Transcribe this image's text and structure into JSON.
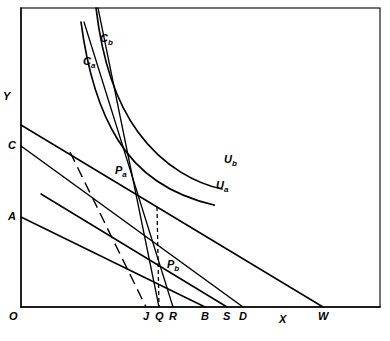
{
  "figure": {
    "kind": "economics-indifference-curve-diagram",
    "background_color": "#ffffff",
    "ink_color": "#000000",
    "axes": {
      "y_label": "Y",
      "x_label": "X",
      "origin_label": "O",
      "origin_px": [
        21,
        307
      ],
      "x_axis_end_px": [
        380,
        307
      ],
      "y_axis_top_px": [
        21,
        8
      ]
    },
    "y_intercept_labels": [
      {
        "name": "C",
        "text": "C",
        "y_px": 146
      },
      {
        "name": "A",
        "text": "A",
        "y_px": 217
      }
    ],
    "x_tick_labels": [
      {
        "name": "J",
        "text": "J",
        "x_px": 146
      },
      {
        "name": "Q",
        "text": "Q",
        "x_px": 159
      },
      {
        "name": "R",
        "text": "R",
        "x_px": 173
      },
      {
        "name": "B",
        "text": "B",
        "x_px": 205
      },
      {
        "name": "S",
        "text": "S",
        "x_px": 227
      },
      {
        "name": "D",
        "text": "D",
        "x_px": 243
      },
      {
        "name": "W",
        "text": "W",
        "x_px": 323
      }
    ],
    "curve_labels": [
      {
        "name": "Cb",
        "base": "C",
        "subscript": "b",
        "x_px": 100,
        "y_px": 33
      },
      {
        "name": "Ca",
        "base": "C",
        "subscript": "a",
        "x_px": 83,
        "y_px": 56
      },
      {
        "name": "Ub",
        "base": "U",
        "subscript": "b",
        "x_px": 224,
        "y_px": 154
      },
      {
        "name": "Ua",
        "base": "U",
        "subscript": "a",
        "x_px": 216,
        "y_px": 180
      },
      {
        "name": "Pa",
        "base": "P",
        "subscript": "a",
        "x_px": 115,
        "y_px": 165
      },
      {
        "name": "Pb",
        "base": "P",
        "subscript": "b",
        "x_px": 167,
        "y_px": 259
      }
    ],
    "equilibrium_points": [
      {
        "name": "Pa",
        "x_px": 112,
        "y_px": 174
      },
      {
        "name": "Pb",
        "x_px": 165,
        "y_px": 272
      }
    ],
    "indifference_curves": [
      {
        "name": "Ua",
        "label": "Ua",
        "path": "M 81,22 C 86,60 96,105 118,140 C 140,176 175,196 214,205"
      },
      {
        "name": "Ub",
        "label": "Ub",
        "path": "M 96,8 C 101,50 113,98 138,132 C 164,168 198,184 222,189"
      }
    ],
    "budget_lines": [
      {
        "name": "budget-C-to-D",
        "from_label": "C",
        "to_label": "D",
        "from_px": [
          21,
          146
        ],
        "to_px": [
          243,
          307
        ]
      },
      {
        "name": "budget-top-to-W",
        "from_label": "",
        "to_label": "W",
        "from_px": [
          21,
          125
        ],
        "to_px": [
          323,
          307
        ]
      },
      {
        "name": "budget-A-to-B",
        "from_label": "A",
        "to_label": "B",
        "from_px": [
          21,
          217
        ],
        "to_px": [
          205,
          307
        ]
      },
      {
        "name": "budget-mid-to-S",
        "from_label": "",
        "to_label": "S",
        "from_px": [
          41,
          194
        ],
        "to_px": [
          227,
          307
        ]
      },
      {
        "name": "price-line-upper-to-R",
        "from_label": "",
        "to_label": "R",
        "from_px": [
          84,
          22
        ],
        "to_px": [
          173,
          307
        ]
      },
      {
        "name": "price-line-lower-to-Q",
        "from_label": "",
        "to_label": "Q",
        "from_px": [
          98,
          8
        ],
        "to_px": [
          159,
          307
        ]
      }
    ],
    "dashed_lines": [
      {
        "name": "dashed-price-line-to-J",
        "to_label": "J",
        "from_px": [
          70,
          152
        ],
        "to_px": [
          146,
          307
        ]
      },
      {
        "name": "dashed-drop-Pb-to-Q",
        "to_label": "Q",
        "from_px": [
          157,
          207
        ],
        "to_px": [
          159,
          307
        ]
      }
    ]
  }
}
